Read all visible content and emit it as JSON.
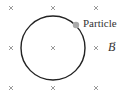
{
  "diagram": {
    "field": {
      "symbol": "B",
      "arrow": "→",
      "direction": "into-page",
      "marker": "×",
      "marker_color": "#999999",
      "grid": [
        {
          "x": 11,
          "y": 8
        },
        {
          "x": 53,
          "y": 8
        },
        {
          "x": 96,
          "y": 8
        },
        {
          "x": 11,
          "y": 48
        },
        {
          "x": 53,
          "y": 48
        },
        {
          "x": 96,
          "y": 48
        },
        {
          "x": 11,
          "y": 88
        },
        {
          "x": 53,
          "y": 88
        },
        {
          "x": 96,
          "y": 88
        }
      ]
    },
    "orbit": {
      "cx": 53,
      "cy": 48,
      "r": 32,
      "stroke": "#222222"
    },
    "particle": {
      "label": "Particle",
      "x": 76,
      "y": 25,
      "color": "#aaaaaa"
    }
  }
}
